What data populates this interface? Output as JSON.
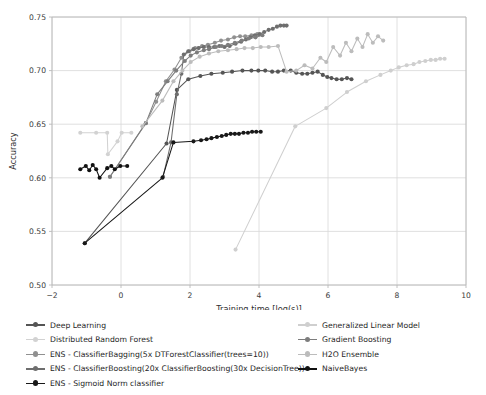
{
  "chart_data": {
    "type": "line",
    "title": "",
    "xlabel": "Training time [log(s)]",
    "ylabel": "Accuracy",
    "xlim": [
      -2,
      10
    ],
    "ylim": [
      0.5,
      0.75
    ],
    "xticks": [
      -2,
      0,
      2,
      4,
      6,
      8,
      10
    ],
    "xtick_labels": [
      "−2",
      "0",
      "2",
      "4",
      "6",
      "8",
      "10"
    ],
    "yticks": [
      0.5,
      0.55,
      0.6,
      0.65,
      0.7,
      0.75
    ],
    "ytick_labels": [
      "0.50",
      "0.55",
      "0.60",
      "0.65",
      "0.70",
      "0.75"
    ],
    "grid": true,
    "legend_position": "below",
    "series": [
      {
        "name": "Deep Learning",
        "color": "#555555",
        "points": [
          [
            -1.05,
            0.539
          ],
          [
            1.32,
            0.632
          ],
          [
            1.62,
            0.682
          ],
          [
            1.95,
            0.692
          ],
          [
            2.3,
            0.695
          ],
          [
            2.62,
            0.697
          ],
          [
            2.95,
            0.698
          ],
          [
            3.22,
            0.699
          ],
          [
            3.52,
            0.7
          ],
          [
            3.78,
            0.7
          ],
          [
            3.98,
            0.7
          ],
          [
            4.18,
            0.7
          ],
          [
            4.38,
            0.699
          ],
          [
            4.55,
            0.699
          ],
          [
            4.72,
            0.7
          ],
          [
            4.92,
            0.7
          ],
          [
            5.08,
            0.698
          ],
          [
            5.25,
            0.697
          ],
          [
            5.4,
            0.697
          ],
          [
            5.55,
            0.698
          ],
          [
            5.7,
            0.699
          ],
          [
            5.85,
            0.696
          ],
          [
            5.98,
            0.694
          ],
          [
            6.1,
            0.693
          ],
          [
            6.25,
            0.692
          ],
          [
            6.4,
            0.692
          ],
          [
            6.55,
            0.693
          ],
          [
            6.68,
            0.692
          ]
        ]
      },
      {
        "name": "Distributed Random Forest",
        "color": "#d2d2d2",
        "points": [
          [
            -1.18,
            0.642
          ],
          [
            -0.72,
            0.642
          ],
          [
            -0.4,
            0.642
          ],
          [
            -0.38,
            0.622
          ],
          [
            -0.1,
            0.634
          ],
          [
            0.02,
            0.642
          ],
          [
            0.3,
            0.642
          ]
        ]
      },
      {
        "name": "ENS - ClassifierBagging(5x DTForestClassifier(trees=10))",
        "color": "#909090",
        "points": [
          [
            -0.32,
            0.601
          ],
          [
            0.72,
            0.651
          ],
          [
            1.02,
            0.671
          ],
          [
            1.3,
            0.69
          ],
          [
            1.55,
            0.701
          ],
          [
            1.75,
            0.712
          ],
          [
            1.98,
            0.718
          ],
          [
            2.15,
            0.721
          ],
          [
            2.35,
            0.723
          ],
          [
            2.52,
            0.724
          ],
          [
            2.72,
            0.726
          ],
          [
            2.9,
            0.728
          ],
          [
            3.1,
            0.729
          ],
          [
            3.28,
            0.731
          ],
          [
            3.45,
            0.732
          ],
          [
            3.6,
            0.732
          ],
          [
            3.78,
            0.733
          ],
          [
            3.95,
            0.734
          ]
        ]
      },
      {
        "name": "ENS - ClassifierBoosting(20x ClassifierBoosting(30x DecisionTree))",
        "color": "#6e6e6e",
        "points": [
          [
            1.22,
            0.601
          ],
          [
            1.45,
            0.633
          ],
          [
            1.62,
            0.678
          ],
          [
            1.75,
            0.697
          ],
          [
            1.82,
            0.715
          ],
          [
            1.95,
            0.718
          ],
          [
            2.1,
            0.72
          ],
          [
            2.25,
            0.721
          ],
          [
            2.4,
            0.722
          ],
          [
            2.55,
            0.722
          ],
          [
            2.7,
            0.722
          ],
          [
            2.85,
            0.723
          ],
          [
            3.0,
            0.722
          ],
          [
            3.15,
            0.723
          ],
          [
            3.32,
            0.725
          ],
          [
            3.48,
            0.727
          ],
          [
            3.62,
            0.729
          ],
          [
            3.75,
            0.731
          ],
          [
            3.88,
            0.733
          ],
          [
            4.02,
            0.734
          ],
          [
            4.15,
            0.736
          ],
          [
            4.28,
            0.738
          ],
          [
            4.4,
            0.739
          ],
          [
            4.52,
            0.741
          ],
          [
            4.62,
            0.742
          ],
          [
            4.72,
            0.742
          ],
          [
            4.8,
            0.742
          ]
        ]
      },
      {
        "name": "ENS - Sigmoid Norm classifier",
        "color": "#181818",
        "points": [
          [
            -1.05,
            0.539
          ],
          [
            1.2,
            0.6
          ],
          [
            1.52,
            0.633
          ],
          [
            2.1,
            0.634
          ],
          [
            2.32,
            0.635
          ],
          [
            2.48,
            0.636
          ],
          [
            2.62,
            0.637
          ],
          [
            2.78,
            0.638
          ],
          [
            2.92,
            0.639
          ],
          [
            3.05,
            0.64
          ],
          [
            3.18,
            0.641
          ],
          [
            3.3,
            0.641
          ],
          [
            3.42,
            0.641
          ],
          [
            3.55,
            0.642
          ],
          [
            3.68,
            0.642
          ],
          [
            3.8,
            0.643
          ],
          [
            3.92,
            0.643
          ],
          [
            4.05,
            0.643
          ]
        ]
      },
      {
        "name": "Generalized Linear Model",
        "color": "#cfcfcf",
        "points": [
          [
            3.32,
            0.533
          ],
          [
            5.05,
            0.648
          ],
          [
            5.95,
            0.665
          ],
          [
            6.55,
            0.68
          ],
          [
            7.1,
            0.69
          ],
          [
            7.52,
            0.696
          ],
          [
            7.82,
            0.7
          ],
          [
            8.05,
            0.703
          ],
          [
            8.28,
            0.705
          ],
          [
            8.48,
            0.706
          ],
          [
            8.65,
            0.708
          ],
          [
            8.82,
            0.709
          ],
          [
            8.98,
            0.71
          ],
          [
            9.12,
            0.71
          ],
          [
            9.25,
            0.711
          ],
          [
            9.38,
            0.711
          ]
        ]
      },
      {
        "name": "Gradient Boosting",
        "color": "#7d7d7d",
        "points": [
          [
            -0.32,
            0.601
          ],
          [
            0.72,
            0.651
          ],
          [
            1.05,
            0.678
          ],
          [
            1.35,
            0.69
          ],
          [
            1.6,
            0.7
          ],
          [
            1.85,
            0.709
          ],
          [
            2.02,
            0.714
          ],
          [
            2.2,
            0.717
          ],
          [
            2.4,
            0.719
          ],
          [
            2.55,
            0.72
          ],
          [
            2.75,
            0.722
          ],
          [
            2.92,
            0.723
          ],
          [
            3.1,
            0.724
          ],
          [
            3.3,
            0.726
          ],
          [
            3.5,
            0.728
          ],
          [
            3.7,
            0.73
          ],
          [
            3.9,
            0.731
          ],
          [
            4.1,
            0.733
          ]
        ]
      },
      {
        "name": "H2O Ensemble",
        "color": "#bcbcbc",
        "points": [
          [
            0.62,
            0.648
          ],
          [
            1.2,
            0.672
          ],
          [
            1.52,
            0.69
          ],
          [
            1.78,
            0.7
          ],
          [
            2.02,
            0.708
          ],
          [
            2.28,
            0.713
          ],
          [
            2.55,
            0.716
          ],
          [
            2.82,
            0.718
          ],
          [
            3.1,
            0.719
          ],
          [
            3.35,
            0.72
          ],
          [
            3.58,
            0.721
          ],
          [
            3.82,
            0.721
          ],
          [
            4.05,
            0.722
          ],
          [
            4.28,
            0.722
          ],
          [
            4.55,
            0.723
          ],
          [
            4.8,
            0.699
          ],
          [
            5.08,
            0.7
          ],
          [
            5.32,
            0.705
          ],
          [
            5.55,
            0.702
          ],
          [
            5.78,
            0.712
          ],
          [
            5.95,
            0.708
          ],
          [
            6.15,
            0.722
          ],
          [
            6.35,
            0.714
          ],
          [
            6.52,
            0.726
          ],
          [
            6.68,
            0.718
          ],
          [
            6.85,
            0.73
          ],
          [
            7.0,
            0.722
          ],
          [
            7.15,
            0.734
          ],
          [
            7.3,
            0.726
          ],
          [
            7.45,
            0.732
          ],
          [
            7.6,
            0.728
          ]
        ]
      },
      {
        "name": "NaiveBayes",
        "color": "#111111",
        "points": [
          [
            -1.18,
            0.608
          ],
          [
            -1.02,
            0.611
          ],
          [
            -0.92,
            0.607
          ],
          [
            -0.82,
            0.612
          ],
          [
            -0.72,
            0.608
          ],
          [
            -0.62,
            0.6
          ],
          [
            -0.4,
            0.609
          ],
          [
            -0.28,
            0.611
          ],
          [
            -0.18,
            0.608
          ],
          [
            -0.02,
            0.611
          ],
          [
            0.18,
            0.611
          ]
        ]
      }
    ]
  },
  "legend": {
    "left_column": [
      {
        "label": "Deep Learning",
        "color": "#555555"
      },
      {
        "label": "Distributed Random Forest",
        "color": "#d2d2d2"
      },
      {
        "label": "ENS - ClassifierBagging(5x DTForestClassifier(trees=10))",
        "color": "#909090"
      },
      {
        "label": "ENS - ClassifierBoosting(20x ClassifierBoosting(30x DecisionTree))",
        "color": "#6e6e6e"
      },
      {
        "label": "ENS - Sigmoid Norm classifier",
        "color": "#181818"
      }
    ],
    "right_column": [
      {
        "label": "Generalized Linear Model",
        "color": "#cfcfcf"
      },
      {
        "label": "Gradient Boosting",
        "color": "#7d7d7d"
      },
      {
        "label": "H2O Ensemble",
        "color": "#bcbcbc"
      },
      {
        "label": "NaiveBayes",
        "color": "#111111"
      }
    ]
  }
}
